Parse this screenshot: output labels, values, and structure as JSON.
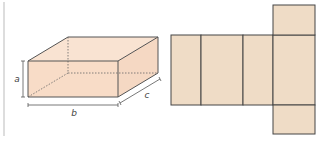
{
  "figure": {
    "box": {
      "labels": {
        "height": "a",
        "length": "b",
        "depth": "c"
      },
      "fill_color": "#f7dcc8",
      "edge_color": "#555555"
    },
    "net": {
      "fill_color": "#efdcc6",
      "edge_color": "#444444",
      "faces": 6
    }
  }
}
